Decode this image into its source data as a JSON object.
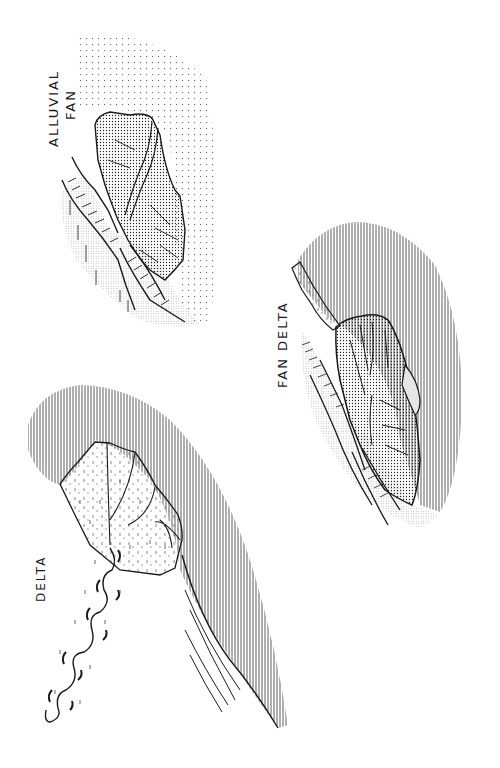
{
  "figure": {
    "type": "geomorphology comparison sketch",
    "panels": [
      {
        "id": "alluvial-fan",
        "label_line1": "ALLUVIAL",
        "label_line2": "FAN",
        "setting": "fan deposited on dry land at mountain front"
      },
      {
        "id": "fan-delta",
        "label": "FAN DELTA",
        "setting": "fan prograding directly into standing water"
      },
      {
        "id": "delta",
        "label": "DELTA",
        "setting": "meandering river building a lobate delta into standing water"
      }
    ]
  },
  "legend_patterns": {
    "fine_dots": "fan sediment",
    "sparse_dot_grid": "alluvial plain",
    "vertical_hatch": "standing water",
    "grey_stipple": "valley slopes / upland"
  },
  "colors": {
    "ink": "#1a1a1a",
    "stipple": "#9a9a9a",
    "background": "#ffffff"
  }
}
